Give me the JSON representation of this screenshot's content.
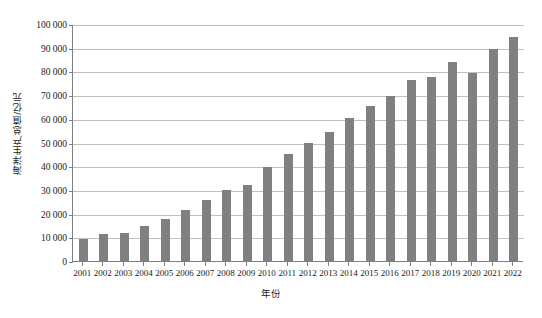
{
  "chart_data": {
    "type": "bar",
    "title": "",
    "subtitle": "",
    "xlabel": "年份",
    "ylabel": "海洋生产总值/亿元",
    "ylim": [
      0,
      100000
    ],
    "ytick_step": 10000,
    "ytick_labels": [
      "0",
      "10 000",
      "20 000",
      "30 000",
      "40 000",
      "50 000",
      "60 000",
      "70 000",
      "80 000",
      "90 000",
      "100 000"
    ],
    "ytick_values": [
      0,
      10000,
      20000,
      30000,
      40000,
      50000,
      60000,
      70000,
      80000,
      90000,
      100000
    ],
    "grid": "horizontal",
    "legend": "none",
    "bar_color": "#808080",
    "categories": [
      "2001",
      "2002",
      "2003",
      "2004",
      "2005",
      "2006",
      "2007",
      "2008",
      "2009",
      "2010",
      "2011",
      "2012",
      "2013",
      "2014",
      "2015",
      "2016",
      "2017",
      "2018",
      "2019",
      "2020",
      "2021",
      "2022"
    ],
    "values": [
      9500,
      11300,
      11700,
      14700,
      17600,
      21600,
      25600,
      30000,
      32200,
      39600,
      45300,
      50000,
      54300,
      60500,
      65500,
      69700,
      76500,
      77700,
      84000,
      79500,
      89500,
      94600
    ],
    "series": [
      {
        "name": "海洋生产总值",
        "values": [
          9500,
          11300,
          11700,
          14700,
          17600,
          21600,
          25600,
          30000,
          32200,
          39600,
          45300,
          50000,
          54300,
          60500,
          65500,
          69700,
          76500,
          77700,
          84000,
          79500,
          89500,
          94600
        ]
      }
    ],
    "annotations": []
  },
  "axis": {
    "y_title": "海洋生产总值/亿元",
    "x_title": "年份"
  }
}
